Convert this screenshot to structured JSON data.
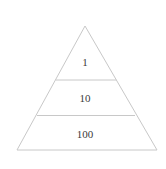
{
  "diagram": {
    "type": "pyramid",
    "levels": [
      {
        "label": "1"
      },
      {
        "label": "10"
      },
      {
        "label": "100"
      }
    ],
    "colors": {
      "line": "#c8c8c8",
      "text": "#3a3a3a",
      "background": "#ffffff"
    }
  }
}
